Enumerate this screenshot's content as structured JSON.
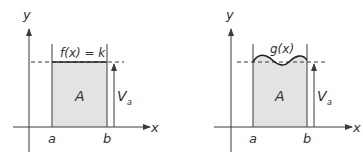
{
  "colors": {
    "line": "#3a3a3a",
    "fill": "#e3e3e3",
    "text": "#333333"
  },
  "diagrams": [
    {
      "id": "left",
      "axis_x_label": "x",
      "axis_y_label": "y",
      "function_label": "f(x) = k",
      "area_label": "A",
      "height_label": "V",
      "height_label_sub": "a",
      "bound_a": "a",
      "bound_b": "b",
      "curve": "constant"
    },
    {
      "id": "right",
      "axis_x_label": "x",
      "axis_y_label": "y",
      "function_label": "g(x)",
      "area_label": "A",
      "height_label": "V",
      "height_label_sub": "a",
      "bound_a": "a",
      "bound_b": "b",
      "curve": "wavy"
    }
  ]
}
